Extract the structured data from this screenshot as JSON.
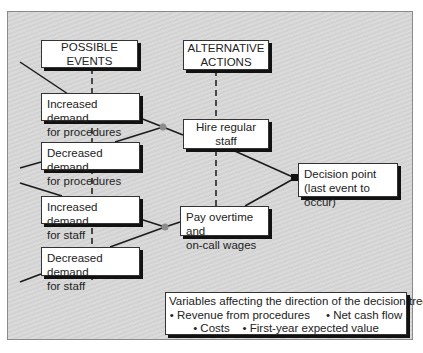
{
  "diagram": {
    "headers": {
      "events": "POSSIBLE EVENTS",
      "actions_line1": "ALTERNATIVE",
      "actions_line2": "ACTIONS"
    },
    "events": [
      {
        "line1": "Increased demand",
        "line2": "for procedures"
      },
      {
        "line1": "Decreased demand",
        "line2": "for procedures"
      },
      {
        "line1": "Increased demand",
        "line2": "for staff"
      },
      {
        "line1": "Decreased demand",
        "line2": "for staff"
      }
    ],
    "actions": [
      {
        "line1": "Hire regular staff"
      },
      {
        "line1": "Pay overtime and",
        "line2": "on-call wages"
      }
    ],
    "decision": {
      "line1": "Decision point",
      "line2": "(last event to occur)"
    },
    "variables": {
      "title": "Variables affecting the direction of the decision tree:",
      "row1": "• Revenue from procedures     • Net cash flow",
      "row2": "• Costs    • First-year expected value"
    },
    "colors": {
      "background": "#d6d6d6",
      "box": "#ffffff",
      "line": "#1a1a1a",
      "node": "#8c8c8c"
    }
  }
}
